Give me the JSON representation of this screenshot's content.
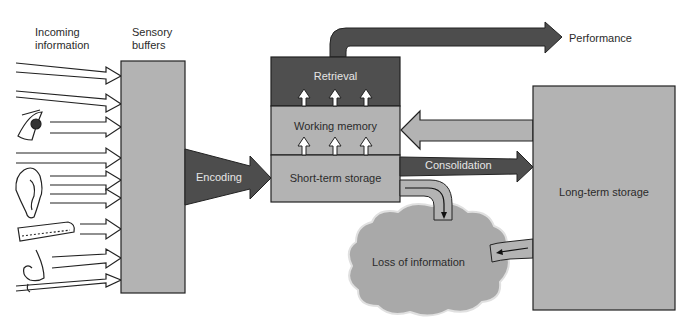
{
  "diagram": {
    "type": "memory-model-flow",
    "colors": {
      "dark": "#4a4a4a",
      "mid": "#a9a9a9",
      "light": "#bdbdbd",
      "outline": "#222222",
      "background": "#ffffff"
    },
    "labels": {
      "incoming": "Incoming\ninformation",
      "incoming_line1": "Incoming",
      "incoming_line2": "information",
      "sensory_line1": "Sensory",
      "sensory_line2": "buffers",
      "encoding": "Encoding",
      "retrieval": "Retrieval",
      "working_memory": "Working memory",
      "short_term_storage": "Short-term storage",
      "performance": "Performance",
      "consolidation": "Consolidation",
      "long_term_storage": "Long-term storage",
      "loss_of_information": "Loss of information"
    },
    "senses": [
      "eye",
      "ear",
      "finger",
      "nose"
    ],
    "nodes": [
      {
        "id": "sensory-buffers",
        "label": "Sensory buffers"
      },
      {
        "id": "short-term-storage",
        "label": "Short-term storage"
      },
      {
        "id": "working-memory",
        "label": "Working memory"
      },
      {
        "id": "retrieval",
        "label": "Retrieval"
      },
      {
        "id": "long-term-storage",
        "label": "Long-term storage"
      },
      {
        "id": "loss-of-information",
        "label": "Loss of information"
      }
    ],
    "edges": [
      {
        "from": "incoming-information",
        "to": "sensory-buffers"
      },
      {
        "from": "sensory-buffers",
        "to": "short-term-storage",
        "label": "Encoding"
      },
      {
        "from": "short-term-storage",
        "to": "working-memory"
      },
      {
        "from": "working-memory",
        "to": "retrieval"
      },
      {
        "from": "retrieval",
        "to": "performance",
        "label": "Performance"
      },
      {
        "from": "short-term-storage",
        "to": "long-term-storage",
        "label": "Consolidation"
      },
      {
        "from": "long-term-storage",
        "to": "working-memory"
      },
      {
        "from": "short-term-storage",
        "to": "loss-of-information"
      },
      {
        "from": "long-term-storage",
        "to": "loss-of-information"
      }
    ]
  }
}
